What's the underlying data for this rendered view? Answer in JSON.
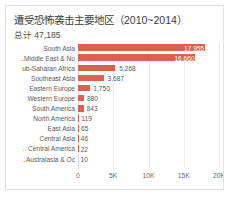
{
  "chart_data": {
    "type": "bar",
    "orientation": "horizontal",
    "title": "遭受恐怖袭击主要地区（2010~2014）",
    "subtitle": "总计  47,185",
    "xlabel": "",
    "ylabel": "",
    "xlim": [
      0,
      20000
    ],
    "grid": true,
    "legend": false,
    "bar_color": "#d9614f",
    "label_color_inside": "#ffffff",
    "label_color_outside": "#5a5a5a",
    "total": 47185,
    "total_label": "47,185",
    "xticks": [
      {
        "value": 0,
        "label": "0"
      },
      {
        "value": 5000,
        "label": "5K"
      },
      {
        "value": 10000,
        "label": "10K"
      },
      {
        "value": 15000,
        "label": "15K"
      },
      {
        "value": 20000,
        "label": "20K"
      }
    ],
    "categories": [
      "South Asia",
      "Middle East & No..",
      "ub-Saharan Africa",
      "Southeast Asia",
      "Eastern Europe",
      "Western Europe",
      "South America",
      "North America",
      "East Asia",
      "Central Asia",
      "Central America ..",
      "Australasia & Oc.."
    ],
    "values": [
      17955,
      16660,
      5268,
      3687,
      1750,
      880,
      843,
      119,
      65,
      46,
      22,
      10
    ],
    "value_labels": [
      "17,955",
      "16,660",
      "5,268",
      "3,687",
      "1,750",
      "880",
      "843",
      "119",
      "65",
      "46",
      "22",
      "10"
    ],
    "label_position": [
      "inside",
      "inside",
      "outside",
      "outside",
      "outside",
      "outside",
      "outside",
      "outside",
      "outside",
      "outside",
      "outside",
      "outside"
    ]
  }
}
